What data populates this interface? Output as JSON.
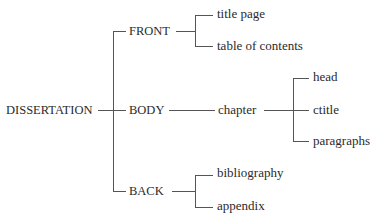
{
  "diagram": {
    "type": "tree",
    "root": {
      "label": "DISSERTATION",
      "children": [
        {
          "label": "FRONT",
          "children": [
            {
              "label": "title page"
            },
            {
              "label": "table of contents"
            }
          ]
        },
        {
          "label": "BODY",
          "children": [
            {
              "label": "chapter",
              "children": [
                {
                  "label": "head"
                },
                {
                  "label": "ctitle"
                },
                {
                  "label": "paragraphs"
                }
              ]
            }
          ]
        },
        {
          "label": "BACK",
          "children": [
            {
              "label": "bibliography"
            },
            {
              "label": "appendix"
            }
          ]
        }
      ]
    },
    "line_color": "#555555"
  },
  "labels": {
    "root": "DISSERTATION",
    "front": "FRONT",
    "body": "BODY",
    "back": "BACK",
    "title_page": "title page",
    "toc": "table of contents",
    "chapter": "chapter",
    "head": "head",
    "ctitle": "ctitle",
    "paragraphs": "paragraphs",
    "bibliography": "bibliography",
    "appendix": "appendix"
  }
}
